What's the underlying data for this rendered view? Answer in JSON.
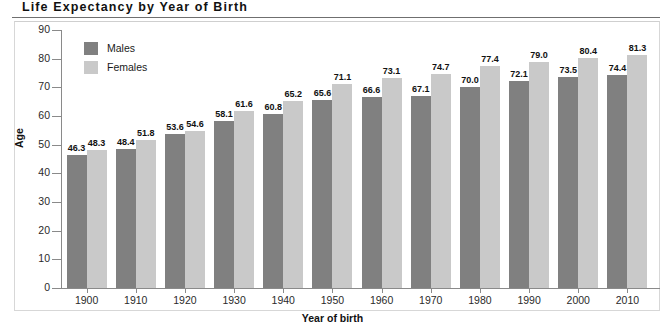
{
  "header": {
    "title": "Life Expectancy by Year of Birth"
  },
  "legend": {
    "items": [
      {
        "label": "Males",
        "color": "#808080",
        "key": "males"
      },
      {
        "label": "Females",
        "color": "#c9c9c9",
        "key": "females"
      }
    ]
  },
  "axes": {
    "y_title": "Age",
    "x_title": "Year of birth",
    "y_ticks": [
      "0",
      "10",
      "20",
      "30",
      "40",
      "50",
      "60",
      "70",
      "80",
      "90"
    ]
  },
  "chart_data": {
    "type": "bar",
    "title": "Life Expectancy by Year of Birth",
    "xlabel": "Year of birth",
    "ylabel": "Age",
    "ylim": [
      0,
      90
    ],
    "ytick_step": 10,
    "grid": false,
    "legend_position": "top-left-inside",
    "categories": [
      "1900",
      "1910",
      "1920",
      "1930",
      "1940",
      "1950",
      "1960",
      "1970",
      "1980",
      "1990",
      "2000",
      "2010"
    ],
    "series": [
      {
        "name": "Males",
        "color": "#808080",
        "values": [
          46.3,
          48.4,
          53.6,
          58.1,
          60.8,
          65.6,
          66.6,
          67.1,
          70.0,
          72.1,
          73.5,
          74.4
        ],
        "labels": [
          "46.3",
          "48.4",
          "53.6",
          "58.1",
          "60.8",
          "65.6",
          "66.6",
          "67.1",
          "70.0",
          "72.1",
          "73.5",
          "74.4"
        ]
      },
      {
        "name": "Females",
        "color": "#c9c9c9",
        "values": [
          48.3,
          51.8,
          54.6,
          61.6,
          65.2,
          71.1,
          73.1,
          74.7,
          77.4,
          79.0,
          80.4,
          81.3
        ],
        "labels": [
          "48.3",
          "51.8",
          "54.6",
          "61.6",
          "65.2",
          "71.1",
          "73.1",
          "74.7",
          "77.4",
          "79.0",
          "80.4",
          "81.3"
        ]
      }
    ]
  }
}
